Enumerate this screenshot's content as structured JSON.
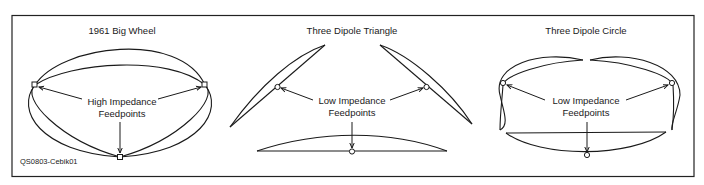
{
  "figure": {
    "caption_id": "QS0803-Cebik01",
    "colors": {
      "line": "#1a1a1a",
      "background": "#ffffff",
      "frame": "#222222"
    }
  },
  "panels": [
    {
      "title": "1961 Big Wheel",
      "label_line1": "High Impedance",
      "label_line2": "Feedpoints",
      "feedpoint_shape": "square",
      "feedpoint_count": 3
    },
    {
      "title": "Three Dipole Triangle",
      "label_line1": "Low Impedance",
      "label_line2": "Feedpoints",
      "feedpoint_shape": "circle",
      "feedpoint_count": 3
    },
    {
      "title": "Three Dipole Circle",
      "label_line1": "Low Impedance",
      "label_line2": "Feedpoints",
      "feedpoint_shape": "circle",
      "feedpoint_count": 3
    }
  ]
}
